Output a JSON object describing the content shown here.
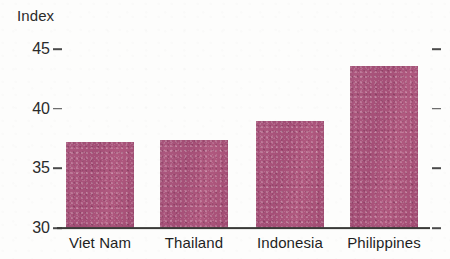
{
  "chart_data": {
    "type": "bar",
    "title": "",
    "subtitle": "",
    "xlabel": "",
    "ylabel": "Index",
    "categories": [
      "Viet Nam",
      "Thailand",
      "Indonesia",
      "Philippines"
    ],
    "values": [
      37.2,
      37.4,
      39.0,
      43.6
    ],
    "series": [
      {
        "name": "Index",
        "values": [
          37.2,
          37.4,
          39.0,
          43.6
        ]
      }
    ],
    "ylim": [
      30,
      45
    ],
    "yticks": [
      30,
      35,
      40,
      45
    ],
    "ytick_labels": [
      "30",
      "35",
      "40",
      "45"
    ],
    "grid": false,
    "legend": false,
    "legend_position": "none",
    "bar_color": "#a8517a",
    "axis_color": "#3a3a38",
    "text_color": "#1f1f1f",
    "right_axis_ticks": true,
    "annotations": []
  },
  "axis": {
    "y_title": "Index"
  }
}
